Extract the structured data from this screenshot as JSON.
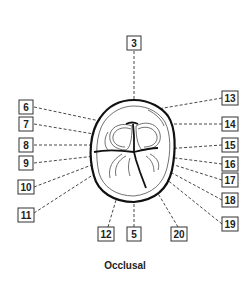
{
  "figure": {
    "caption": "Occlusal",
    "labels": [
      {
        "id": "3",
        "text": "3"
      },
      {
        "id": "5",
        "text": "5"
      },
      {
        "id": "6",
        "text": "6"
      },
      {
        "id": "7",
        "text": "7"
      },
      {
        "id": "8",
        "text": "8"
      },
      {
        "id": "9",
        "text": "9"
      },
      {
        "id": "10",
        "text": "10"
      },
      {
        "id": "11",
        "text": "11"
      },
      {
        "id": "12",
        "text": "12"
      },
      {
        "id": "13",
        "text": "13"
      },
      {
        "id": "14",
        "text": "14"
      },
      {
        "id": "15",
        "text": "15"
      },
      {
        "id": "16",
        "text": "16"
      },
      {
        "id": "17",
        "text": "17"
      },
      {
        "id": "18",
        "text": "18"
      },
      {
        "id": "19",
        "text": "19"
      },
      {
        "id": "20",
        "text": "20"
      }
    ]
  }
}
